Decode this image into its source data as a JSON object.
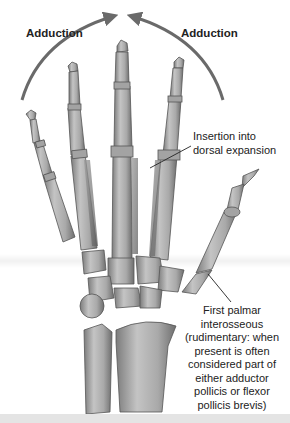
{
  "diagram": {
    "arrows": [
      {
        "label": "Adduction",
        "direction": "right",
        "side": "left"
      },
      {
        "label": "Adduction",
        "direction": "left",
        "side": "right"
      }
    ],
    "callouts": [
      {
        "id": "insertion",
        "lines": [
          "Insertion into",
          "dorsal expansion"
        ]
      },
      {
        "id": "first_palmar",
        "lines": [
          "First palmar",
          "interosseous",
          "(rudimentary: when",
          "present is often",
          "considered part of",
          "either adductor",
          "pollicis or flexor",
          "pollicis brevis)"
        ]
      }
    ],
    "colors": {
      "bone": "#b3b3b3",
      "bone_shade": "#7e7e7e",
      "bone_outline": "#555555",
      "arrow": "#6a6a6a",
      "text": "#222222",
      "background": "#ffffff",
      "bottom_band": "#e4e4e4"
    }
  }
}
